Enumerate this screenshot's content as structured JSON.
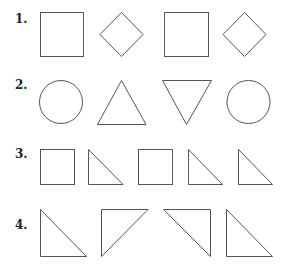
{
  "rows": [
    {
      "label": "1.",
      "shapes": [
        "square",
        "diamond",
        "square",
        "diamond"
      ]
    },
    {
      "label": "2.",
      "shapes": [
        "circle",
        "triangle-up",
        "triangle-down",
        "circle"
      ]
    },
    {
      "label": "3.",
      "shapes": [
        "square",
        "right-triangle",
        "square",
        "right-triangle",
        "right-triangle"
      ]
    },
    {
      "label": "4.",
      "shapes": [
        "right-triangle-bottom-left",
        "right-triangle-top-left",
        "right-triangle-top-right",
        "right-triangle-bottom-left"
      ]
    }
  ],
  "colors": {
    "stroke": "#555555",
    "label": "#222222",
    "background": "#ffffff"
  }
}
